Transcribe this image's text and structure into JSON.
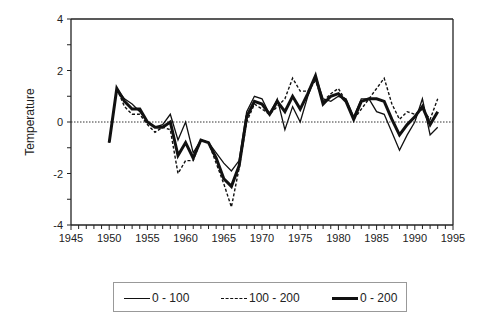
{
  "chart_data": {
    "type": "line",
    "title": "",
    "xlabel": "",
    "ylabel": "Temperature",
    "xlim": [
      1945,
      1995
    ],
    "ylim": [
      -4,
      4
    ],
    "xticks": [
      1945,
      1950,
      1955,
      1960,
      1965,
      1970,
      1975,
      1980,
      1985,
      1990,
      1995
    ],
    "yticks": [
      -4,
      -2,
      0,
      2,
      4
    ],
    "reference_line": {
      "y": 0,
      "style": "dotted"
    },
    "legend_position": "bottom",
    "x": [
      1950,
      1951,
      1952,
      1953,
      1954,
      1955,
      1956,
      1957,
      1958,
      1959,
      1960,
      1961,
      1962,
      1963,
      1964,
      1965,
      1966,
      1967,
      1968,
      1969,
      1970,
      1971,
      1972,
      1973,
      1974,
      1975,
      1976,
      1977,
      1978,
      1979,
      1980,
      1981,
      1982,
      1983,
      1984,
      1985,
      1986,
      1987,
      1988,
      1989,
      1990,
      1991,
      1992,
      1993
    ],
    "series": [
      {
        "name": "0 - 100",
        "style": "solid-thin",
        "values": [
          -0.8,
          1.3,
          0.9,
          0.7,
          0.4,
          0.0,
          -0.2,
          -0.1,
          0.3,
          -0.7,
          0.0,
          -1.2,
          -0.7,
          -0.8,
          -1.2,
          -1.6,
          -1.9,
          -1.5,
          0.4,
          1.0,
          0.9,
          0.3,
          0.9,
          -0.3,
          0.6,
          0.0,
          1.0,
          1.8,
          0.9,
          0.8,
          1.0,
          0.9,
          0.2,
          0.9,
          0.9,
          0.4,
          0.3,
          -0.4,
          -1.1,
          -0.5,
          0.0,
          0.9,
          -0.5,
          -0.2
        ]
      },
      {
        "name": "100 - 200",
        "style": "dashed",
        "values": [
          -0.8,
          1.3,
          0.6,
          0.3,
          0.3,
          -0.1,
          -0.4,
          -0.2,
          -0.3,
          -2.0,
          -1.5,
          -1.5,
          -0.7,
          -0.8,
          -1.6,
          -2.4,
          -3.3,
          -1.8,
          0.0,
          0.7,
          0.5,
          0.3,
          0.6,
          0.9,
          1.7,
          1.2,
          1.2,
          1.6,
          0.8,
          1.1,
          1.3,
          0.8,
          0.1,
          0.5,
          0.9,
          1.3,
          1.7,
          0.7,
          0.1,
          0.4,
          0.3,
          0.5,
          0.1,
          0.9
        ]
      },
      {
        "name": "0 - 200",
        "style": "solid-thick",
        "values": [
          -0.8,
          1.3,
          0.8,
          0.5,
          0.5,
          0.0,
          -0.2,
          -0.2,
          0.0,
          -1.3,
          -0.8,
          -1.4,
          -0.7,
          -0.8,
          -1.4,
          -2.2,
          -2.5,
          -1.7,
          0.2,
          0.8,
          0.7,
          0.3,
          0.8,
          0.4,
          1.0,
          0.5,
          1.1,
          1.8,
          0.7,
          1.0,
          1.1,
          0.8,
          0.1,
          0.8,
          0.9,
          0.9,
          0.8,
          0.1,
          -0.5,
          -0.1,
          0.2,
          0.6,
          -0.1,
          0.4
        ]
      }
    ]
  }
}
